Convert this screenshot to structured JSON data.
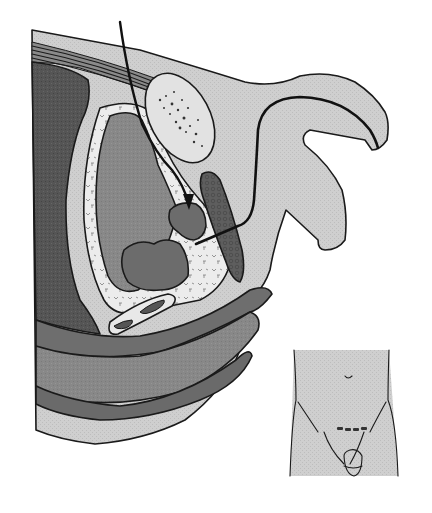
{
  "figure": {
    "kind": "anatomical-illustration",
    "view": "sagittal cross-section of male pelvis with instrument pathway",
    "text_labels": [],
    "colors": {
      "background": "#ffffff",
      "skin": "#cfcfcf",
      "fat_light": "#e4e4e4",
      "muscle_dark": "#5a5a5a",
      "organ_mid": "#8a8a8a",
      "organ_dark": "#6e6e6e",
      "wall_band": "#747474",
      "bone": "#e2e2e2",
      "outline": "#1a1a1a",
      "incision": "#333333"
    },
    "elements": [
      {
        "id": "body-wall",
        "description": "light gray outer body contour"
      },
      {
        "id": "muscle-layers",
        "description": "striated abdominal wall muscle bands"
      },
      {
        "id": "pubic-bone",
        "description": "stippled oval bone"
      },
      {
        "id": "bladder",
        "description": "large organ with mottled white perivesical fat rim"
      },
      {
        "id": "prostate-lobe-upper",
        "description": "small dark lobulated mass"
      },
      {
        "id": "prostate-lobe-lower",
        "description": "larger dark lobulated mass"
      },
      {
        "id": "corpus",
        "description": "dark spindle-shaped erectile tissue"
      },
      {
        "id": "penis-scrotum",
        "description": "external genitalia outline"
      },
      {
        "id": "catheter",
        "description": "black curved tube through urethra"
      },
      {
        "id": "instrument-arrow",
        "description": "needle pathway arrow pointing downward"
      },
      {
        "id": "vessels",
        "description": "two small tubular structures at the base"
      },
      {
        "id": "rectal-layers",
        "description": "curved dark bands of the lower pelvis"
      }
    ],
    "inset": {
      "description": "front view of lower torso showing transverse incision",
      "incision_marks": 4
    }
  }
}
